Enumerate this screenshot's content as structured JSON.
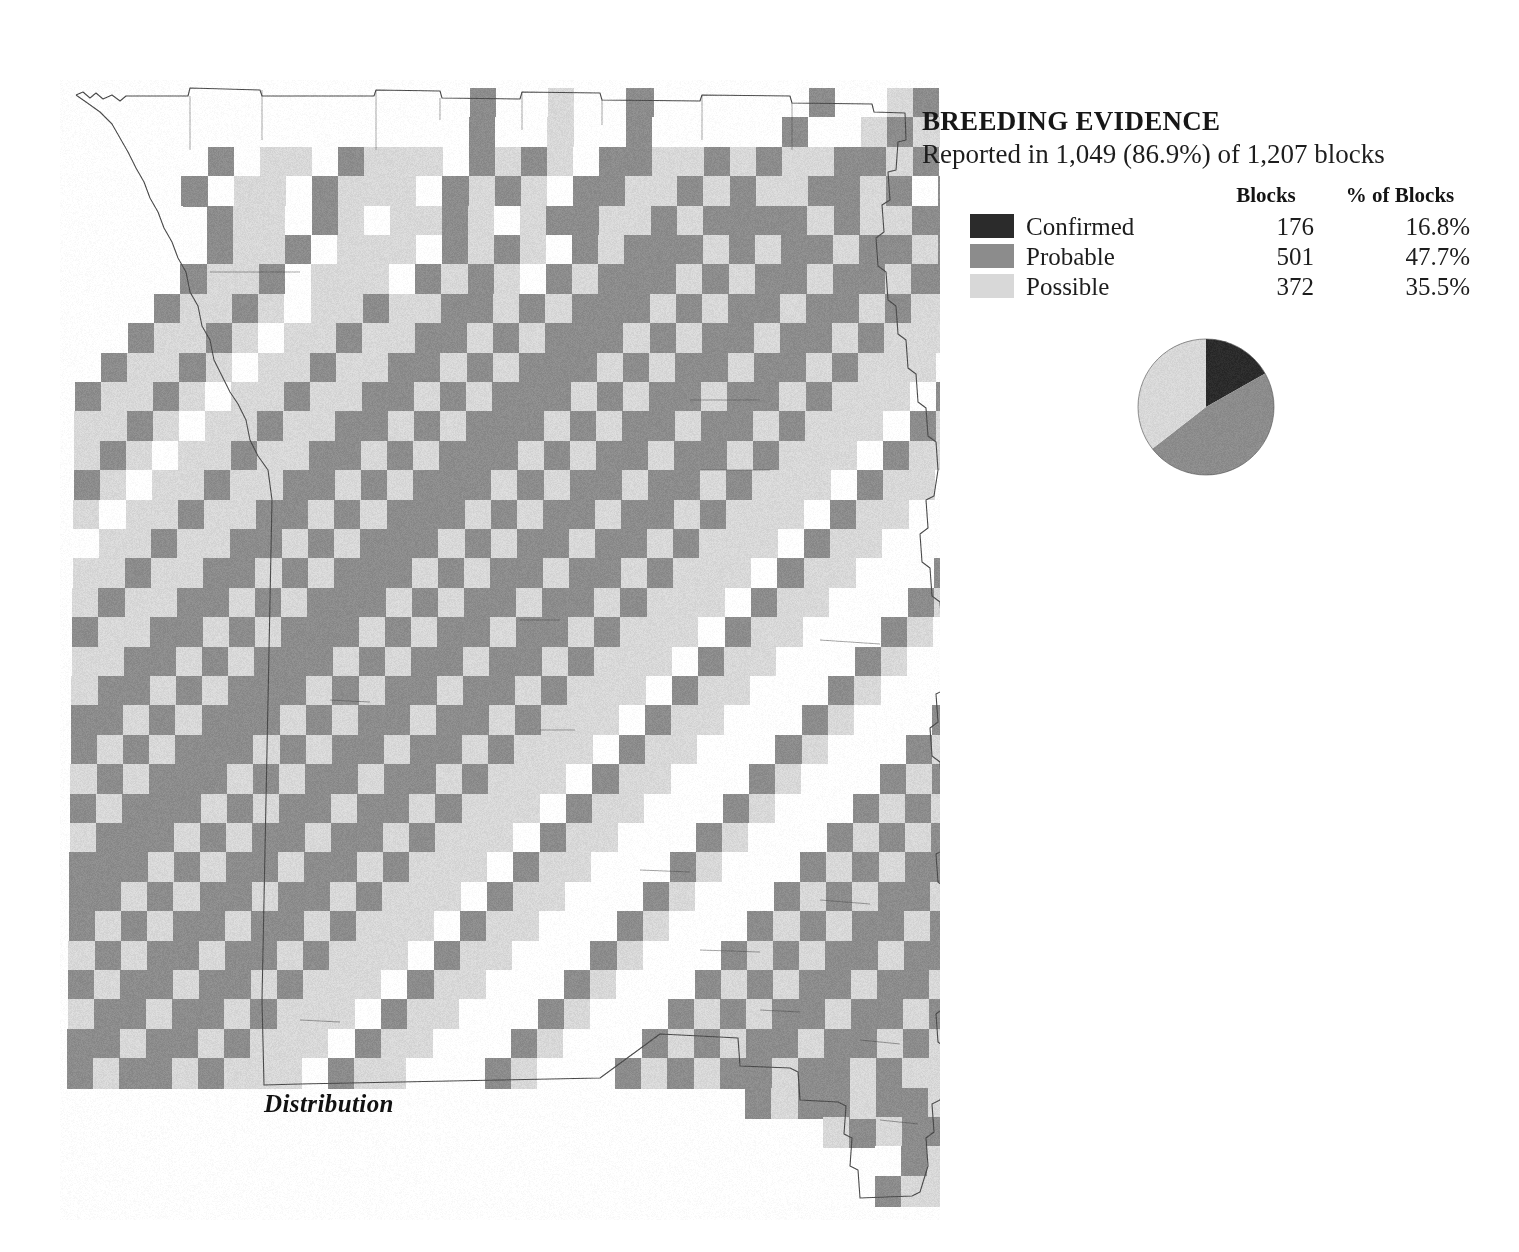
{
  "legend": {
    "title": "BREEDING EVIDENCE",
    "subtitle": "Reported in 1,049 (86.9%) of 1,207 blocks",
    "col_header_blank": "",
    "col_header_blocks": "Blocks",
    "col_header_pct": "% of Blocks",
    "rows": [
      {
        "label": "Confirmed",
        "blocks": "176",
        "pct": "16.8%",
        "color": "#2b2b2b",
        "swatch_name": "confirmed-swatch"
      },
      {
        "label": "Probable",
        "blocks": "501",
        "pct": "47.7%",
        "color": "#8c8c8c",
        "swatch_name": "probable-swatch"
      },
      {
        "label": "Possible",
        "blocks": "372",
        "pct": "35.5%",
        "color": "#d8d8d8",
        "swatch_name": "possible-swatch"
      }
    ]
  },
  "caption": {
    "text": "Distribution"
  },
  "colors": {
    "confirmed": "#2b2b2b",
    "probable": "#8c8c8c",
    "possible": "#d8d8d8",
    "no_evidence": "#ffffff",
    "boundary": "#4a4a4a",
    "background": "#ffffff"
  },
  "chart_data": {
    "type": "pie",
    "categories": [
      "Confirmed",
      "Probable",
      "Possible"
    ],
    "values": [
      16.8,
      47.7,
      35.5
    ],
    "counts": [
      176,
      501,
      372
    ],
    "colors": [
      "#2b2b2b",
      "#8c8c8c",
      "#d8d8d8"
    ],
    "total_blocks": 1207,
    "reported_blocks": 1049,
    "reported_pct": 86.9,
    "legend_position": "above",
    "start_angle_deg": 0,
    "center": [
      70,
      70
    ],
    "radius": 68
  },
  "map": {
    "name": "missouri-breeding-evidence-block-map",
    "origin": {
      "x": 78,
      "y": 88
    },
    "cell": {
      "w": 26.1,
      "h": 29.4
    },
    "cols": 42,
    "rows": 38,
    "skew_per_row_px": -0.33,
    "legend_codes": {
      "0": "no-evidence",
      "1": "possible",
      "2": "probable",
      "3": "confirmed"
    },
    "rows_data": [
      "..............02001002.0000020012010211220000",
      "..............0200100200000200121102112210000",
      "...0.2011021110212102211212112212022121121100",
      "...0201102111021210221121211221202212112110..",
      "...0.21102101121012211212222121122121102110..",
      "...0021120111021210212221212212212211021100..",
      "..002112011102121021222121221221221102110...0",
      "..0211210112112212122212122122121110211000..0",
      ".02112101121122121222121221221211102110002..0",
      ".21121011211221212221212212212111021100021.00",
      "211210112112212122212122122121110211000210002",
      "11210112112212122212122122121110211000210002.",
      "12101121122121222121221221211102110002100021.",
      "21011211221212221212212212111021100021000212.",
      "10112112212122212122122121110211000210002121.",
      "01121122121222121221221211102110002100021212.",
      "11211221212221212212212111021100021000212122.",
      "12112212122212122122121110211000210002121221.",
      "21122121222121221221211102110002100021212212.",
      "11221212221212212212111021100021000212122122.",
      "12212122212122122121110211000210002121221221.",
      "22121222121221221211102110002100021212212212.",
      "21212221212212212111021100021000212122122121.",
      "12122212122122121110211000210002121221221211.",
      "21222121221221211102110002100021212212212111.",
      "12221212212212111021100021000212122122121110.",
      "22212122122121110211000210002121221221211102.",
      "22121221221211102110002100021212212212111021.",
      "21212212212111021100021000212122122121110211.",
      "12122122121110211000210002121221221211102110.",
      "21221221211102110002100021212212212111021100.",
      "12212212111021100021000212122122121110211000.",
      "22122121110211000210002121221221211102110002.",
      "21221211102110002100021212212212111021100021.",
      "..........................21221221211102110..",
      ".............................1221211102110...",
      "...............................221211102.....",
      "................................2121110......"
    ]
  }
}
